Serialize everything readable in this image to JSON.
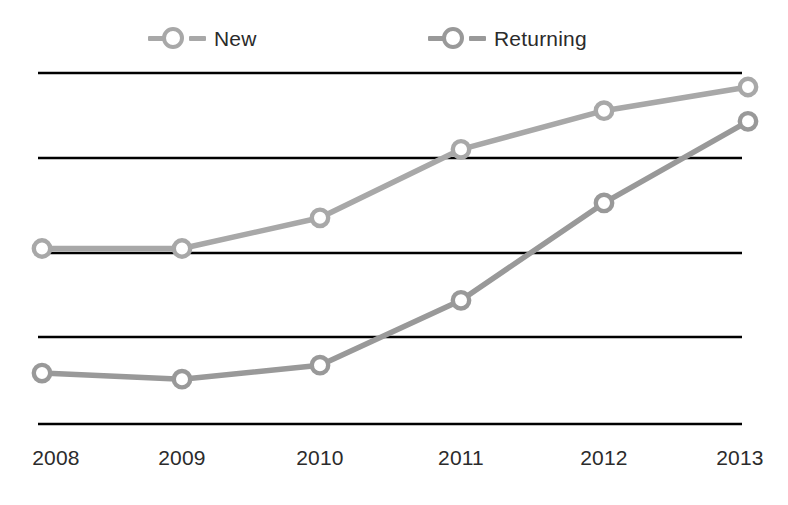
{
  "chart_data": {
    "type": "line",
    "title": "",
    "subtitle": "",
    "xlabel": "",
    "ylabel": "",
    "categories": [
      "2008",
      "2009",
      "2010",
      "2011",
      "2012",
      "2013"
    ],
    "x": [
      2008,
      2009,
      2010,
      2011,
      2012,
      2013
    ],
    "series": [
      {
        "name": "New",
        "color": "#a8a8a8",
        "marker": "open-circle",
        "values": [
          2.0,
          2.0,
          2.35,
          3.13,
          3.57,
          3.84
        ]
      },
      {
        "name": "Returning",
        "color": "#999999",
        "marker": "open-circle",
        "values": [
          0.58,
          0.51,
          0.67,
          1.41,
          2.52,
          3.45
        ]
      }
    ],
    "ylim": [
      0,
      4
    ],
    "yticks": [
      0,
      1,
      2,
      3,
      4
    ],
    "ytick_labels": [
      "",
      "",
      "",
      "",
      ""
    ],
    "grid": "horizontal-only",
    "gridline_count": 5,
    "gridline_color": "#000000",
    "legend_position": "top",
    "background": "#ffffff"
  },
  "legend": {
    "items": [
      {
        "label": "New"
      },
      {
        "label": "Returning"
      }
    ]
  },
  "axis": {
    "x_tick_labels": [
      "2008",
      "2009",
      "2010",
      "2011",
      "2012",
      "2013"
    ]
  },
  "colors": {
    "new_line": "#a8a8a8",
    "returning_line": "#999999",
    "gridline": "#000000",
    "text": "#2b2b2b",
    "background": "#ffffff"
  }
}
